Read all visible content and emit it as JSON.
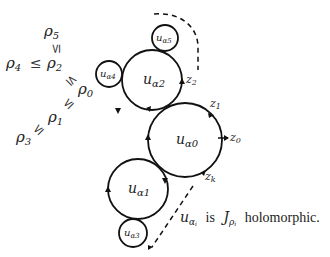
{
  "diagram": {
    "stroke_color": "#111111",
    "circles": [
      {
        "id": "alpha0",
        "label": "u",
        "sub": "α0",
        "cx": 185,
        "cy": 140,
        "r": 37
      },
      {
        "id": "alpha1",
        "label": "u",
        "sub": "α1",
        "cx": 138,
        "cy": 189,
        "r": 30
      },
      {
        "id": "alpha2",
        "label": "u",
        "sub": "α2",
        "cx": 152,
        "cy": 80,
        "r": 30
      },
      {
        "id": "alpha3",
        "label": "u",
        "sub": "α3",
        "cx": 133,
        "cy": 233,
        "r": 14
      },
      {
        "id": "alpha4",
        "label": "u",
        "sub": "α4",
        "cx": 109,
        "cy": 74,
        "r": 13
      },
      {
        "id": "alpha5",
        "label": "u",
        "sub": "α5",
        "cx": 165,
        "cy": 38,
        "r": 13
      }
    ],
    "points": [
      {
        "id": "z0",
        "base": "z",
        "sub": "0"
      },
      {
        "id": "z1",
        "base": "z",
        "sub": "1"
      },
      {
        "id": "z2",
        "base": "z",
        "sub": "2"
      },
      {
        "id": "zk",
        "base": "z",
        "sub": "k"
      }
    ],
    "rho": {
      "r0": {
        "base": "ρ",
        "sub": "0"
      },
      "r1": {
        "base": "ρ",
        "sub": "1"
      },
      "r2": {
        "base": "ρ",
        "sub": "2"
      },
      "r3": {
        "base": "ρ",
        "sub": "3"
      },
      "r4": {
        "base": "ρ",
        "sub": "4"
      },
      "r5": {
        "base": "ρ",
        "sub": "5"
      },
      "leq": "≤"
    },
    "caption": {
      "u": "u",
      "u_sub": "α",
      "u_subsub": "i",
      "is": "is",
      "J": "J",
      "J_sub": "ρ",
      "J_subsub": "i",
      "holomorphic": "holomorphic."
    }
  }
}
